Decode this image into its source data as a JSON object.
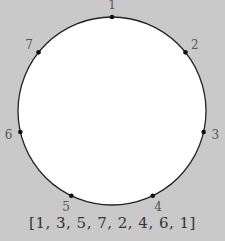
{
  "diagram": {
    "type": "circle-permutation",
    "circle": {
      "cx": 112,
      "cy": 111,
      "r": 94,
      "fill": "#ffffff",
      "stroke": "#222222"
    },
    "background": "#c9c9c9",
    "nodes": [
      {
        "label": "1",
        "angle_deg": -90
      },
      {
        "label": "2",
        "angle_deg": -38.6
      },
      {
        "label": "3",
        "angle_deg": 12.9
      },
      {
        "label": "4",
        "angle_deg": 64.3
      },
      {
        "label": "5",
        "angle_deg": 115.7
      },
      {
        "label": "6",
        "angle_deg": 167.1
      },
      {
        "label": "7",
        "angle_deg": 218.6
      }
    ],
    "caption": "[1, 3, 5, 7, 2, 4, 6, 1]"
  }
}
